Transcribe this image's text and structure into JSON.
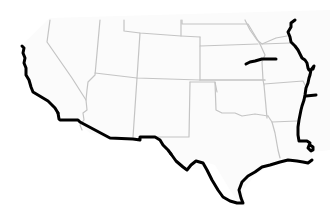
{
  "map": {
    "title": "",
    "region": "Southwestern and South-Central United States",
    "background_color": "#ffffff",
    "land_color": "#fbfbfb",
    "state_border_color": "#c4c4c4",
    "highlight_line_color": "#000000",
    "labels": [],
    "highlighted_features": [
      "pacific-coastline",
      "us-mexico-border",
      "gulf-coastline",
      "mississippi-river",
      "missouri-river-segment"
    ]
  }
}
